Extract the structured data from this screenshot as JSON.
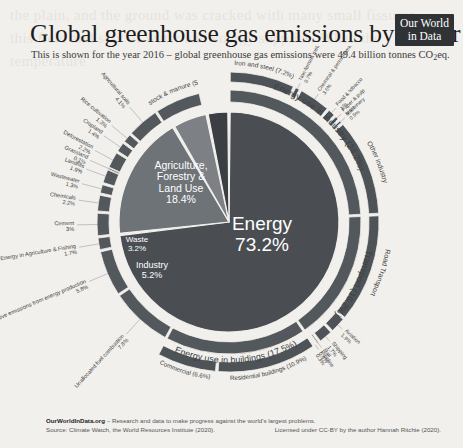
{
  "header": {
    "title": "Global greenhouse gas emissions by sector",
    "subtitle_pre": "This is shown for the year 2016 – global greenhouse gas emissions were 49.4 billion tonnes CO",
    "subtitle_sub": "2",
    "subtitle_post": "eq.",
    "logo_line1": "Our World",
    "logo_line2": "in Data"
  },
  "footer": {
    "brand": "OurWorldInData.org",
    "tagline": "– Research and data to make progress against the world's largest problems.",
    "source": "Source: Climate Watch, the World Resources Institute (2020).",
    "license": "Licensed under CC-BY by the author Hannah Ritchie (2020)."
  },
  "chart_data": {
    "type": "pie",
    "title": "Global greenhouse gas emissions by sector",
    "subtitle": "This is shown for the year 2016 – global greenhouse gas emissions were 49.4 billion tonnes CO2eq.",
    "units": "percent of total greenhouse gas emissions",
    "total_emissions": "49.4 billion tonnes CO2eq",
    "year": 2016,
    "legend": "none",
    "grid": false,
    "rings": [
      {
        "name": "inner",
        "label": "Top-level sector",
        "segments": [
          {
            "label": "Energy",
            "value": 73.2,
            "value_label": "73.2%",
            "color": "#4a4e52"
          },
          {
            "label": "Agriculture, Forestry & Land Use",
            "value": 18.4,
            "value_label": "18.4%",
            "color": "#6e7377"
          },
          {
            "label": "Industry",
            "value": 5.2,
            "value_label": "5.2%",
            "color": "#7d8185"
          },
          {
            "label": "Waste",
            "value": 3.2,
            "value_label": "3.2%",
            "color": "#3b3f43"
          }
        ]
      },
      {
        "name": "middle",
        "label": "Sub-sector",
        "segments": [
          {
            "label": "Energy use in industry",
            "value": 24.2,
            "value_label": "(24.2%)",
            "parent": "Energy"
          },
          {
            "label": "Transport",
            "value": 16.2,
            "value_label": "(16.2%)",
            "parent": "Energy"
          },
          {
            "label": "Energy use in buildings",
            "value": 17.5,
            "value_label": "(17.5%)",
            "parent": "Energy"
          },
          {
            "label": "Unallocated fuel combustion",
            "value": 7.8,
            "value_label": "7.8%",
            "parent": "Energy"
          },
          {
            "label": "Fugitive emissions from energy production",
            "value": 5.8,
            "value_label": "5.8%",
            "parent": "Energy"
          },
          {
            "label": "Energy in Agriculture & Fishing",
            "value": 1.7,
            "value_label": "1.7%",
            "parent": "Energy"
          },
          {
            "label": "Cement",
            "value": 3.0,
            "value_label": "3%",
            "parent": "Industry"
          },
          {
            "label": "Chemicals",
            "value": 2.2,
            "value_label": "2.2%",
            "parent": "Industry"
          },
          {
            "label": "Wastewater",
            "value": 1.3,
            "value_label": "1.3%",
            "parent": "Waste"
          },
          {
            "label": "Landfills",
            "value": 1.9,
            "value_label": "1.9%",
            "parent": "Waste"
          },
          {
            "label": "Grassland",
            "value": 0.1,
            "value_label": "0.1%",
            "parent": "Agriculture, Forestry & Land Use"
          },
          {
            "label": "Deforestation",
            "value": 2.2,
            "value_label": "2.2%",
            "parent": "Agriculture, Forestry & Land Use"
          },
          {
            "label": "Cropland",
            "value": 1.4,
            "value_label": "1.4%",
            "parent": "Agriculture, Forestry & Land Use"
          },
          {
            "label": "Rice cultivation",
            "value": 1.3,
            "value_label": "1.3%",
            "parent": "Agriculture, Forestry & Land Use"
          },
          {
            "label": "Agricultural soils",
            "value": 4.1,
            "value_label": "4.1%",
            "parent": "Agriculture, Forestry & Land Use"
          },
          {
            "label": "Livestock & manure",
            "value": 5.8,
            "value_label": "(5.8%)",
            "parent": "Agriculture, Forestry & Land Use"
          }
        ]
      },
      {
        "name": "outer",
        "label": "Detailed category",
        "segments": [
          {
            "label": "Iron and steel",
            "value": 7.2,
            "value_label": "(7.2%)",
            "parent": "Energy use in industry"
          },
          {
            "label": "Non-ferrous metals",
            "value": 0.7,
            "value_label": "0.7%",
            "parent": "Energy use in industry"
          },
          {
            "label": "Chemical & petrochemical",
            "value": 3.6,
            "value_label": "3.6%",
            "parent": "Energy use in industry"
          },
          {
            "label": "Food & tobacco",
            "value": 1.0,
            "value_label": "1%",
            "parent": "Energy use in industry"
          },
          {
            "label": "Paper & pulp",
            "value": 0.6,
            "value_label": "0.6%",
            "parent": "Energy use in industry"
          },
          {
            "label": "Machinery",
            "value": 0.5,
            "value_label": "0.5%",
            "parent": "Energy use in industry"
          },
          {
            "label": "Other industry",
            "value": 10.6,
            "value_label": "10.6%",
            "parent": "Energy use in industry"
          },
          {
            "label": "Road Transport",
            "value": 11.9,
            "value_label": "11.9%",
            "parent": "Transport"
          },
          {
            "label": "Aviation",
            "value": 1.9,
            "value_label": "1.9%",
            "parent": "Transport"
          },
          {
            "label": "Shipping",
            "value": 1.7,
            "value_label": "1.7%",
            "parent": "Transport"
          },
          {
            "label": "Rail",
            "value": 0.4,
            "value_label": "0.4%",
            "parent": "Transport"
          },
          {
            "label": "Pipeline",
            "value": 0.3,
            "value_label": "0.3%",
            "parent": "Transport"
          },
          {
            "label": "Residential buildings",
            "value": 10.9,
            "value_label": "(10.9%)",
            "parent": "Energy use in buildings"
          },
          {
            "label": "Commercial",
            "value": 6.6,
            "value_label": "(6.6%)",
            "parent": "Energy use in buildings"
          }
        ]
      }
    ]
  },
  "bleed_text": "the plain, and the ground was cracked with many small fissures\nthis field and stay of water and energy supplies. When the temperature\n\n\n\n\n\n\n\n\n\n\n\n\n\n\n\n\n\n\n\n\n\n\n\n\n\n"
}
